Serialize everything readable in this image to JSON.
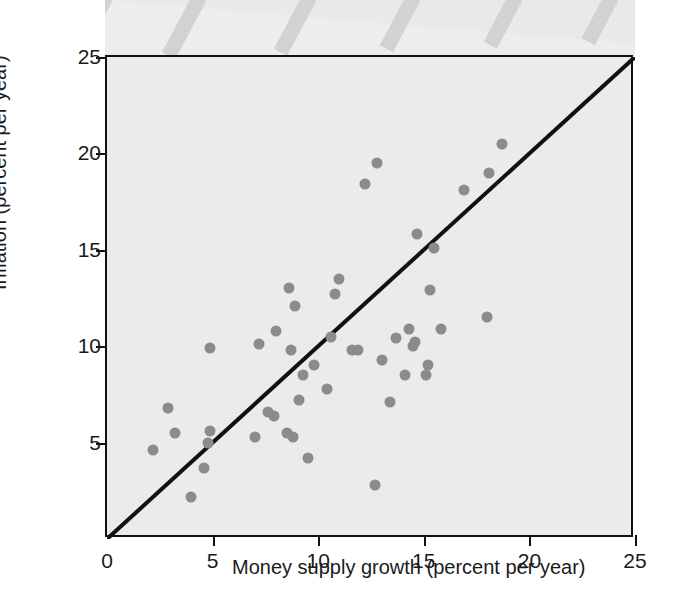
{
  "chart_data": {
    "type": "scatter",
    "title": "",
    "xlabel": "Money supply growth (percent per year)",
    "ylabel": "Inflation (percent per year)",
    "xlim": [
      0,
      25
    ],
    "ylim": [
      0,
      25
    ],
    "xticks": [
      0,
      5,
      10,
      15,
      20,
      25
    ],
    "yticks": [
      5,
      10,
      15,
      20,
      25
    ],
    "xtick_labels": [
      "0",
      "5",
      "10",
      "15",
      "20",
      "25"
    ],
    "ytick_labels": [
      "5",
      "10",
      "15",
      "20",
      "25"
    ],
    "grid": false,
    "legend": null,
    "reference_line": {
      "name": "45-degree line",
      "from": [
        0,
        0
      ],
      "to": [
        25,
        25
      ],
      "color": "#111111"
    },
    "marker_color": "#8b8b8b",
    "plot_background": "#ebebeb",
    "points": [
      {
        "x": 2.2,
        "y": 4.6
      },
      {
        "x": 2.9,
        "y": 6.8
      },
      {
        "x": 3.2,
        "y": 5.5
      },
      {
        "x": 4.0,
        "y": 2.2
      },
      {
        "x": 4.6,
        "y": 3.7
      },
      {
        "x": 4.8,
        "y": 5.0
      },
      {
        "x": 4.9,
        "y": 5.6
      },
      {
        "x": 4.9,
        "y": 9.9
      },
      {
        "x": 7.0,
        "y": 5.3
      },
      {
        "x": 7.2,
        "y": 10.1
      },
      {
        "x": 7.6,
        "y": 6.6
      },
      {
        "x": 7.9,
        "y": 6.4
      },
      {
        "x": 8.0,
        "y": 10.8
      },
      {
        "x": 8.5,
        "y": 5.5
      },
      {
        "x": 8.6,
        "y": 13.0
      },
      {
        "x": 8.7,
        "y": 9.8
      },
      {
        "x": 8.8,
        "y": 5.3
      },
      {
        "x": 8.9,
        "y": 12.1
      },
      {
        "x": 9.1,
        "y": 7.2
      },
      {
        "x": 9.3,
        "y": 8.5
      },
      {
        "x": 9.5,
        "y": 4.2
      },
      {
        "x": 9.8,
        "y": 9.0
      },
      {
        "x": 10.4,
        "y": 7.8
      },
      {
        "x": 10.6,
        "y": 10.5
      },
      {
        "x": 10.8,
        "y": 12.7
      },
      {
        "x": 11.0,
        "y": 13.5
      },
      {
        "x": 11.6,
        "y": 9.8
      },
      {
        "x": 11.9,
        "y": 9.8
      },
      {
        "x": 12.2,
        "y": 18.4
      },
      {
        "x": 12.8,
        "y": 19.5
      },
      {
        "x": 12.7,
        "y": 2.8
      },
      {
        "x": 13.0,
        "y": 9.3
      },
      {
        "x": 13.4,
        "y": 7.1
      },
      {
        "x": 13.7,
        "y": 10.4
      },
      {
        "x": 14.1,
        "y": 8.5
      },
      {
        "x": 14.3,
        "y": 10.9
      },
      {
        "x": 14.5,
        "y": 10.0
      },
      {
        "x": 14.6,
        "y": 10.2
      },
      {
        "x": 14.7,
        "y": 15.8
      },
      {
        "x": 15.1,
        "y": 8.5
      },
      {
        "x": 15.2,
        "y": 9.0
      },
      {
        "x": 15.3,
        "y": 12.9
      },
      {
        "x": 15.5,
        "y": 15.1
      },
      {
        "x": 15.8,
        "y": 10.9
      },
      {
        "x": 16.9,
        "y": 18.1
      },
      {
        "x": 18.0,
        "y": 11.5
      },
      {
        "x": 18.1,
        "y": 19.0
      },
      {
        "x": 18.7,
        "y": 20.5
      }
    ]
  },
  "decoration": {
    "band_label": "decorative-top-band",
    "stripe_count": 6
  }
}
